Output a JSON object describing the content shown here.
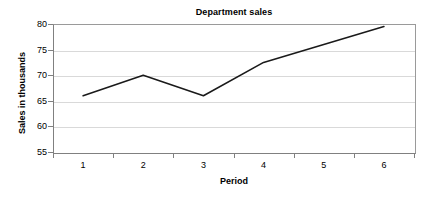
{
  "chart_data": {
    "type": "line",
    "title": "Department sales",
    "xlabel": "Period",
    "ylabel": "Sales in thousands",
    "categories": [
      "1",
      "2",
      "3",
      "4",
      "5",
      "6"
    ],
    "values": [
      66,
      70,
      66,
      72.5,
      76,
      79.5
    ],
    "series": [
      {
        "name": "Department sales",
        "values": [
          66,
          70,
          66,
          72.5,
          76,
          79.5
        ]
      }
    ],
    "ylim": [
      55,
      80
    ],
    "yticks": [
      "55",
      "60",
      "65",
      "70",
      "75",
      "80"
    ],
    "ytick_values": [
      55,
      60,
      65,
      70,
      75,
      80
    ],
    "xticks": [
      "1",
      "2",
      "3",
      "4",
      "5",
      "6"
    ],
    "grid": "horizontal",
    "legend": "none",
    "line_color": "#1a1a1a",
    "grid_color": "#d9d9d9",
    "axis_color": "#808080",
    "background_color": "#ffffff",
    "markers": "none"
  }
}
